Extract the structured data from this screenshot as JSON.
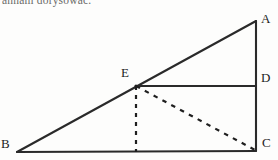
{
  "page": {
    "clipped_text_line": "annam dorysować.",
    "background_color": "#fdfdfc",
    "ink_color": "#232323"
  },
  "figure": {
    "caption_absent": "",
    "stroke_color": "#2a2a2a",
    "dash_color": "#1f1f1f",
    "labels": {
      "A": "A",
      "B": "B",
      "C": "C",
      "D": "D",
      "E": "E"
    },
    "points": {
      "A": {
        "x": 256,
        "y": 21
      },
      "B": {
        "x": 17,
        "y": 152
      },
      "C": {
        "x": 256,
        "y": 151
      },
      "D": {
        "x": 256,
        "y": 86
      },
      "E": {
        "x": 136,
        "y": 86
      },
      "F": {
        "x": 136,
        "y": 152
      }
    },
    "segments": [
      {
        "name": "BA",
        "from": "B",
        "to": "A",
        "style": "solid"
      },
      {
        "name": "AC",
        "from": "A",
        "to": "C",
        "style": "solid"
      },
      {
        "name": "BC",
        "from": "B",
        "to": "C",
        "style": "solid"
      },
      {
        "name": "ED",
        "from": "E",
        "to": "D",
        "style": "solid"
      },
      {
        "name": "EF",
        "from": "E",
        "to": "F",
        "style": "dashed"
      },
      {
        "name": "EC",
        "from": "E",
        "to": "C",
        "style": "dashed"
      }
    ]
  }
}
